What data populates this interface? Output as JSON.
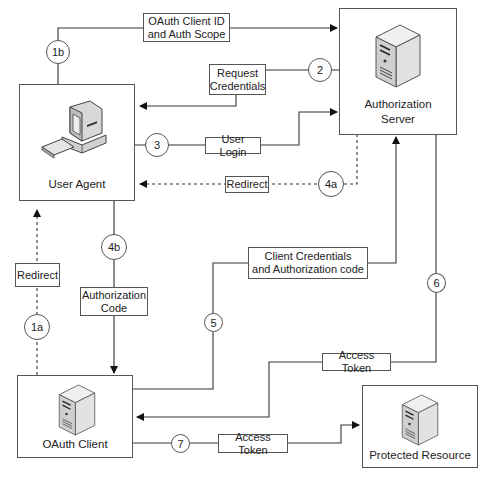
{
  "diagram": {
    "type": "OAuth authorization code flow",
    "nodes": {
      "user_agent": {
        "label": "User Agent",
        "icon": "desktop-computer-icon"
      },
      "auth_server": {
        "label": "Authorization\nServer",
        "icon": "server-tower-icon"
      },
      "oauth_client": {
        "label": "OAuth Client",
        "icon": "server-tower-icon"
      },
      "protected_resource": {
        "label": "Protected Resource",
        "icon": "server-tower-icon"
      }
    },
    "steps": [
      {
        "id": "1a",
        "label": "Redirect",
        "from": "OAuth Client",
        "to": "User Agent",
        "style": "dashed"
      },
      {
        "id": "1b",
        "label": "OAuth Client ID\nand Auth Scope",
        "from": "User Agent",
        "to": "Authorization Server",
        "style": "solid"
      },
      {
        "id": "2",
        "label": "Request\nCredentials",
        "from": "Authorization Server",
        "to": "User Agent",
        "style": "solid"
      },
      {
        "id": "3",
        "label": "User Login",
        "from": "User Agent",
        "to": "Authorization Server",
        "style": "solid"
      },
      {
        "id": "4a",
        "label": "Redirect",
        "from": "Authorization Server",
        "to": "User Agent",
        "style": "dashed"
      },
      {
        "id": "4b",
        "label": "Authorization\nCode",
        "from": "User Agent",
        "to": "OAuth Client",
        "style": "solid"
      },
      {
        "id": "5",
        "label": "Client Credentials\nand Authorization code",
        "from": "OAuth Client",
        "to": "Authorization Server",
        "style": "solid"
      },
      {
        "id": "6",
        "label": "Access Token",
        "from": "Authorization Server",
        "to": "OAuth Client",
        "style": "solid"
      },
      {
        "id": "7",
        "label": "Access Token",
        "from": "OAuth Client",
        "to": "Protected Resource",
        "style": "solid"
      }
    ],
    "colors": {
      "line": "#333333",
      "box_border": "#555555",
      "background": "#ffffff"
    }
  }
}
